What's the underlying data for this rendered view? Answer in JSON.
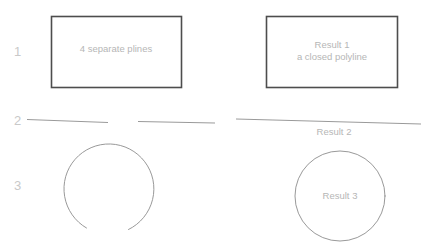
{
  "diagram": {
    "background_color": "#ffffff",
    "rect_stroke_color": "#4d4d4d",
    "curve_stroke_color": "#8d8d8d",
    "label_text_color": "#b6b6b6",
    "row_number_color": "#c9c9c9"
  },
  "rows": [
    {
      "number": "1",
      "before_label": "4 separate plines",
      "after_label_line1": "Result 1",
      "after_label_line2": "a closed polyline"
    },
    {
      "number": "2",
      "before_label": "",
      "after_label_line1": "Result 2",
      "after_label_line2": ""
    },
    {
      "number": "3",
      "before_label": "",
      "after_label_line1": "Result 3",
      "after_label_line2": ""
    }
  ]
}
